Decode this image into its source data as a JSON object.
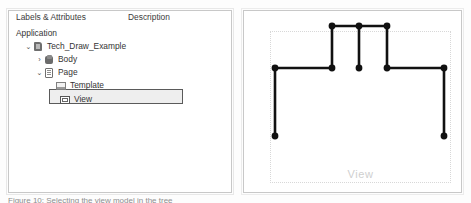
{
  "tree_panel": {
    "columns": {
      "labels": "Labels & Attributes",
      "description": "Description"
    },
    "rows": [
      {
        "label": "Application",
        "icon": "none",
        "chevron": "",
        "indent": 0
      },
      {
        "label": "Tech_Draw_Example",
        "icon": "document-3d-icon",
        "chevron": "⌄",
        "indent": 1
      },
      {
        "label": "Body",
        "icon": "body-icon",
        "chevron": "›",
        "indent": 2
      },
      {
        "label": "Page",
        "icon": "page-icon",
        "chevron": "⌄",
        "indent": 2
      },
      {
        "label": "Template",
        "icon": "template-icon",
        "chevron": "",
        "indent": 3
      },
      {
        "label": "View",
        "icon": "view-icon",
        "chevron": "",
        "indent": 3,
        "selected": true
      }
    ],
    "selected_row_label": "View"
  },
  "drawing_panel": {
    "view_label": "View",
    "sheet_border_style": "dotted",
    "line_color": "#111111",
    "vertex_color": "#111111"
  },
  "caption": {
    "text": "Figure 10: Selecting the view model in the tree"
  },
  "chart_data": {
    "type": "line",
    "title": "View",
    "xlabel": "",
    "ylabel": "",
    "outline_points": [
      [
        31,
        125
      ],
      [
        31,
        57
      ],
      [
        88,
        57
      ],
      [
        88,
        15
      ],
      [
        143,
        15
      ],
      [
        143,
        57
      ],
      [
        200,
        57
      ],
      [
        200,
        125
      ]
    ],
    "vertices": [
      [
        31,
        57
      ],
      [
        88,
        57
      ],
      [
        115,
        57
      ],
      [
        143,
        57
      ],
      [
        200,
        57
      ],
      [
        88,
        15
      ],
      [
        115,
        15
      ],
      [
        143,
        15
      ],
      [
        31,
        125
      ],
      [
        200,
        125
      ]
    ],
    "interior_lines": [
      [
        [
          115,
          15
        ],
        [
          115,
          57
        ]
      ]
    ],
    "xlim": [
      0,
      219
    ],
    "ylim": [
      0,
      183
    ],
    "grid": false,
    "legend": "none"
  }
}
